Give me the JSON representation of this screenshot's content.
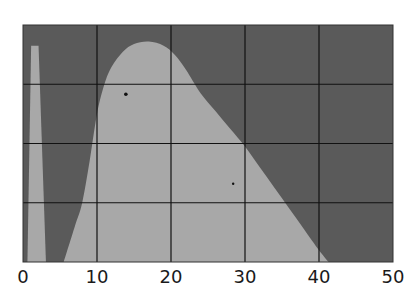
{
  "chart_data": {
    "type": "area",
    "title": "",
    "xlabel": "",
    "ylabel": "",
    "xlim": [
      0,
      50
    ],
    "ylim": [
      0,
      4
    ],
    "grid": true,
    "x_ticks": [
      0,
      10,
      20,
      30,
      40,
      50
    ],
    "x_tick_labels": [
      "0",
      "10",
      "20",
      "30",
      "40",
      "50"
    ],
    "y_gridlines": [
      1,
      2,
      3
    ],
    "colors": {
      "background": "#5a5a5a",
      "fill": "#a8a8a8",
      "grid": "#111111",
      "marker": "#111111"
    },
    "series": [
      {
        "name": "narrow-spike",
        "points": [
          [
            0.6,
            0
          ],
          [
            1.1,
            3.65
          ],
          [
            2.1,
            3.65
          ],
          [
            3.1,
            0
          ]
        ]
      },
      {
        "name": "broad-peak",
        "points": [
          [
            5.5,
            0
          ],
          [
            7.0,
            0.6
          ],
          [
            8.0,
            1.0
          ],
          [
            9.0,
            1.7
          ],
          [
            10.0,
            2.5
          ],
          [
            11.0,
            3.0
          ],
          [
            12.0,
            3.3
          ],
          [
            13.5,
            3.55
          ],
          [
            15.0,
            3.68
          ],
          [
            17.0,
            3.72
          ],
          [
            19.0,
            3.65
          ],
          [
            20.5,
            3.5
          ],
          [
            22.0,
            3.25
          ],
          [
            24.0,
            2.85
          ],
          [
            26.0,
            2.55
          ],
          [
            28.0,
            2.25
          ],
          [
            30.0,
            1.95
          ],
          [
            32.0,
            1.6
          ],
          [
            34.0,
            1.25
          ],
          [
            36.0,
            0.9
          ],
          [
            38.0,
            0.55
          ],
          [
            40.0,
            0.2
          ],
          [
            41.3,
            0
          ]
        ]
      }
    ],
    "markers": [
      {
        "x": 13.9,
        "y": 2.83
      },
      {
        "x": 28.4,
        "y": 1.32
      }
    ]
  }
}
